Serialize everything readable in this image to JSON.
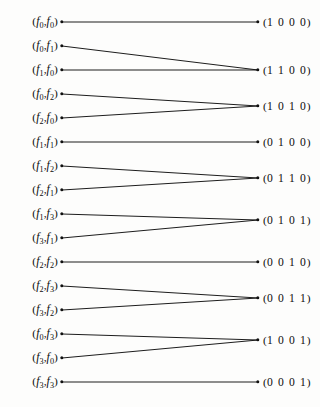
{
  "figure": {
    "kind": "bipartite-mapping-diagram",
    "width": 320,
    "height": 407,
    "background_color": "#fdfdfc",
    "ink_color": "#111111"
  },
  "geometry": {
    "left_node_x": 62,
    "right_node_x": 258,
    "left_label_right_edge": 58,
    "right_label_left_edge": 263,
    "first_row_y": 22,
    "row_spacing": 23.95
  },
  "left_nodes": [
    {
      "id": "f0f0",
      "a": "0",
      "b": "0",
      "y": 22,
      "target": "1000"
    },
    {
      "id": "f0f1",
      "a": "0",
      "b": "1",
      "y": 46,
      "target": "1100"
    },
    {
      "id": "f1f0",
      "a": "1",
      "b": "0",
      "y": 70,
      "target": "1100"
    },
    {
      "id": "f0f2",
      "a": "0",
      "b": "2",
      "y": 94,
      "target": "1010"
    },
    {
      "id": "f2f0",
      "a": "2",
      "b": "0",
      "y": 118,
      "target": "1010"
    },
    {
      "id": "f1f1",
      "a": "1",
      "b": "1",
      "y": 142,
      "target": "0100"
    },
    {
      "id": "f1f2",
      "a": "1",
      "b": "2",
      "y": 166,
      "target": "0110"
    },
    {
      "id": "f2f1",
      "a": "2",
      "b": "1",
      "y": 190,
      "target": "0110"
    },
    {
      "id": "f1f3",
      "a": "1",
      "b": "3",
      "y": 214,
      "target": "0101"
    },
    {
      "id": "f3f1",
      "a": "3",
      "b": "1",
      "y": 238,
      "target": "0101"
    },
    {
      "id": "f2f2",
      "a": "2",
      "b": "2",
      "y": 262,
      "target": "0010"
    },
    {
      "id": "f2f3",
      "a": "2",
      "b": "3",
      "y": 286,
      "target": "0011"
    },
    {
      "id": "f3f2",
      "a": "3",
      "b": "2",
      "y": 310,
      "target": "0011"
    },
    {
      "id": "f0f3",
      "a": "0",
      "b": "3",
      "y": 334,
      "target": "1001"
    },
    {
      "id": "f3f0",
      "a": "3",
      "b": "0",
      "y": 358,
      "target": "1001"
    },
    {
      "id": "f3f3",
      "a": "3",
      "b": "3",
      "y": 382,
      "target": "0001"
    }
  ],
  "right_nodes": [
    {
      "id": "1000",
      "bits": "1 0 0 0",
      "y": 22
    },
    {
      "id": "1100",
      "bits": "1 1 0 0",
      "y": 70
    },
    {
      "id": "1010",
      "bits": "1 0 1 0",
      "y": 106
    },
    {
      "id": "0100",
      "bits": "0 1 0 0",
      "y": 142
    },
    {
      "id": "0110",
      "bits": "0 1 1 0",
      "y": 178
    },
    {
      "id": "0101",
      "bits": "0 1 0 1",
      "y": 220
    },
    {
      "id": "0010",
      "bits": "0 0 1 0",
      "y": 262
    },
    {
      "id": "0011",
      "bits": "0 0 1 1",
      "y": 298
    },
    {
      "id": "1001",
      "bits": "1 0 0 1",
      "y": 340
    },
    {
      "id": "0001",
      "bits": "0 0 0 1",
      "y": 382
    }
  ],
  "glyphs": {
    "open_paren": "(",
    "close_paren": ")",
    "comma": ",",
    "function_symbol": "f"
  }
}
